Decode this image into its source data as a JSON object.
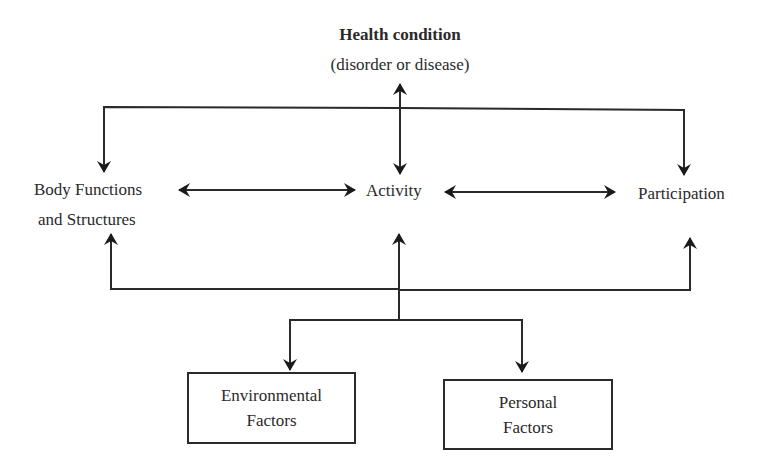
{
  "diagram": {
    "health_condition": {
      "title": "Health condition",
      "subtitle": "(disorder or disease)"
    },
    "nodes": {
      "body_functions": {
        "line1": "Body Functions",
        "line2": "and Structures"
      },
      "activity": {
        "label": "Activity"
      },
      "participation": {
        "label": "Participation"
      },
      "environmental_factors": {
        "line1": "Environmental",
        "line2": "Factors"
      },
      "personal_factors": {
        "line1": "Personal",
        "line2": "Factors"
      }
    },
    "connections": [
      {
        "from": "health_condition",
        "to": "activity",
        "type": "bidirectional"
      },
      {
        "from": "health_condition",
        "to": "body_functions",
        "type": "directed"
      },
      {
        "from": "health_condition",
        "to": "participation",
        "type": "directed"
      },
      {
        "from": "body_functions",
        "to": "activity",
        "type": "bidirectional"
      },
      {
        "from": "activity",
        "to": "participation",
        "type": "bidirectional"
      },
      {
        "from": "contextual_factors",
        "to": "activity",
        "type": "directed"
      },
      {
        "from": "contextual_factors",
        "to": "body_functions",
        "type": "directed"
      },
      {
        "from": "contextual_factors",
        "to": "participation",
        "type": "directed"
      },
      {
        "from": "activity",
        "to": "environmental_factors",
        "type": "directed"
      },
      {
        "from": "activity",
        "to": "personal_factors",
        "type": "directed"
      }
    ],
    "colors": {
      "line": "#2a2a2a",
      "background": "#ffffff"
    }
  }
}
